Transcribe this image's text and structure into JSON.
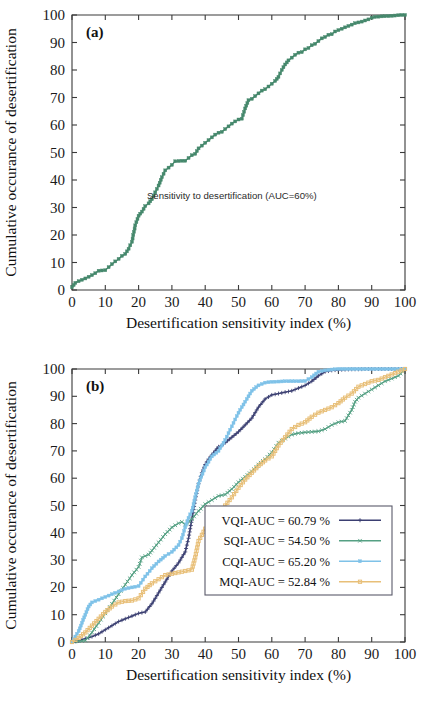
{
  "figure": {
    "background": "#ffffff"
  },
  "panel_a": {
    "tag": "(a)",
    "annotation": "Sensitivity to desertification (AUC=60%)",
    "xlabel": "Desertification sensitivity index (%)",
    "ylabel": "Cumulative occurance of desertification",
    "series_color": "#45886c"
  },
  "panel_b": {
    "tag": "(b)",
    "xlabel": "Desertification sensitivity index (%)",
    "ylabel": "Cumulative occurance of desertification",
    "legend": [
      {
        "label": "VQI-AUC = 60.79 %",
        "color": "#3b3f72",
        "marker": "plus"
      },
      {
        "label": "SQI-AUC = 54.50 %",
        "color": "#55a083",
        "marker": "cross"
      },
      {
        "label": "CQI-AUC = 65.20 %",
        "color": "#7fc2e8",
        "marker": "square"
      },
      {
        "label": "MQI-AUC = 52.84 %",
        "color": "#e8bf78",
        "marker": "square-open"
      }
    ]
  },
  "chart_data": [
    {
      "type": "line",
      "id": "panel-a",
      "title": "(a)",
      "xlabel": "Desertification sensitivity index (%)",
      "ylabel": "Cumulative occurance of desertification",
      "xlim": [
        0,
        100
      ],
      "ylim": [
        0,
        100
      ],
      "xticks": [
        0,
        10,
        20,
        30,
        40,
        50,
        60,
        70,
        80,
        90,
        100
      ],
      "yticks": [
        0,
        10,
        20,
        30,
        40,
        50,
        60,
        70,
        80,
        90,
        100
      ],
      "grid": false,
      "legend_position": "none",
      "annotations": [
        {
          "text": "Sensitivity to desertification (AUC=60%)",
          "x": 48,
          "y": 33
        }
      ],
      "series": [
        {
          "name": "Sensitivity to desertification (AUC=60%)",
          "color": "#45886c",
          "marker": "square",
          "x": [
            0,
            1,
            2,
            3,
            4,
            5,
            6,
            7,
            8,
            9,
            10,
            11,
            12,
            13,
            14,
            15,
            16,
            17,
            18,
            19,
            20,
            21,
            22,
            23,
            24,
            25,
            26,
            27,
            28,
            29,
            30,
            31,
            32,
            33,
            34,
            35,
            36,
            37,
            38,
            39,
            40,
            41,
            42,
            43,
            44,
            45,
            46,
            47,
            48,
            49,
            50,
            51,
            52,
            53,
            54,
            55,
            56,
            57,
            58,
            59,
            60,
            61,
            62,
            63,
            64,
            65,
            66,
            67,
            68,
            69,
            70,
            71,
            72,
            73,
            74,
            75,
            76,
            77,
            78,
            79,
            80,
            81,
            82,
            83,
            84,
            85,
            86,
            87,
            88,
            89,
            90,
            91,
            92,
            93,
            94,
            95,
            96,
            97,
            98,
            99,
            100
          ],
          "y": [
            1.0,
            2.6,
            3.2,
            3.7,
            4.2,
            4.8,
            5.4,
            6.1,
            7.0,
            7.1,
            7.2,
            8.3,
            9.4,
            10.4,
            11.3,
            12.4,
            13.1,
            15.0,
            17.5,
            23.5,
            27.0,
            28.5,
            30.5,
            31.5,
            33.0,
            35.5,
            38.0,
            41.0,
            43.5,
            44.5,
            45.5,
            46.8,
            46.9,
            47.0,
            47.0,
            48.0,
            49.0,
            49.5,
            51.5,
            52.5,
            53.5,
            54.5,
            55.5,
            56.5,
            57.2,
            57.5,
            58.5,
            59.5,
            60.5,
            61.3,
            62.0,
            62.3,
            66.0,
            69.0,
            69.5,
            70.5,
            71.5,
            72.5,
            73.0,
            74.0,
            75.0,
            76.0,
            77.5,
            80.0,
            82.0,
            83.5,
            84.5,
            85.5,
            86.3,
            86.5,
            87.5,
            88.0,
            89.0,
            89.5,
            90.5,
            91.5,
            92.0,
            92.8,
            93.0,
            94.0,
            94.5,
            95.0,
            95.5,
            96.0,
            96.5,
            97.0,
            97.3,
            97.6,
            98.0,
            98.4,
            99.0,
            99.3,
            99.4,
            99.5,
            99.55,
            99.6,
            99.7,
            99.8,
            99.9,
            100.0,
            100.0
          ]
        }
      ]
    },
    {
      "type": "line",
      "id": "panel-b",
      "title": "(b)",
      "xlabel": "Desertification sensitivity index (%)",
      "ylabel": "Cumulative occurance of desertification",
      "xlim": [
        0,
        100
      ],
      "ylim": [
        0,
        100
      ],
      "xticks": [
        0,
        10,
        20,
        30,
        40,
        50,
        60,
        70,
        80,
        90,
        100
      ],
      "yticks": [
        0,
        10,
        20,
        30,
        40,
        50,
        60,
        70,
        80,
        90,
        100
      ],
      "grid": false,
      "legend_position": "lower-right",
      "series": [
        {
          "name": "VQI-AUC = 60.79 %",
          "color": "#3b3f72",
          "marker": "plus",
          "x": [
            0,
            2,
            4,
            6,
            8,
            10,
            12,
            14,
            16,
            18,
            20,
            22,
            24,
            26,
            28,
            30,
            32,
            34,
            35,
            36,
            37,
            38,
            39,
            40,
            41,
            42,
            43,
            44,
            45,
            46,
            48,
            50,
            52,
            54,
            56,
            58,
            60,
            62,
            64,
            66,
            68,
            70,
            72,
            74,
            76,
            78,
            80,
            82,
            84,
            86,
            88,
            90,
            92,
            94,
            96,
            98,
            100
          ],
          "y": [
            0,
            0.5,
            1.2,
            2.0,
            3.0,
            4.5,
            6.0,
            7.5,
            8.5,
            9.5,
            10.5,
            11.0,
            14.0,
            18.0,
            22.0,
            26.0,
            29.0,
            33.0,
            38.0,
            45.0,
            52.0,
            58.0,
            62.0,
            65.0,
            67.0,
            68.5,
            70.0,
            71.5,
            72.0,
            73.0,
            75.0,
            77.0,
            79.5,
            82.0,
            86.0,
            89.0,
            90.5,
            91.0,
            91.5,
            92.0,
            93.0,
            94.0,
            95.5,
            97.5,
            99.0,
            99.5,
            99.7,
            99.8,
            99.9,
            99.9,
            100,
            100,
            100,
            100,
            100,
            100,
            100
          ]
        },
        {
          "name": "SQI-AUC = 54.50 %",
          "color": "#55a083",
          "marker": "cross",
          "x": [
            0,
            2,
            4,
            6,
            8,
            10,
            12,
            14,
            16,
            18,
            20,
            21,
            22,
            23,
            24,
            26,
            28,
            30,
            32,
            33,
            34,
            36,
            38,
            40,
            42,
            44,
            46,
            48,
            50,
            52,
            54,
            56,
            58,
            60,
            62,
            64,
            66,
            68,
            70,
            72,
            74,
            76,
            78,
            80,
            82,
            84,
            85,
            86,
            88,
            90,
            92,
            94,
            96,
            98,
            100
          ],
          "y": [
            0,
            0.3,
            0.5,
            3.5,
            7.0,
            10.5,
            14.0,
            17.5,
            21.0,
            24.5,
            27.5,
            31.0,
            31.5,
            32.0,
            33.5,
            36.5,
            39.5,
            42.0,
            43.5,
            44.0,
            43.0,
            45.0,
            48.0,
            50.5,
            52.0,
            53.5,
            54.0,
            56.0,
            58.5,
            60.5,
            62.5,
            65.0,
            67.0,
            69.5,
            73.0,
            74.5,
            76.0,
            76.5,
            76.8,
            77.0,
            77.2,
            78.0,
            79.5,
            80.5,
            81.0,
            85.0,
            88.0,
            89.5,
            91.0,
            92.5,
            94.0,
            95.5,
            96.5,
            97.5,
            100
          ]
        },
        {
          "name": "CQI-AUC = 65.20 %",
          "color": "#7fc2e8",
          "marker": "square",
          "x": [
            0,
            1,
            2,
            3,
            4,
            5,
            6,
            8,
            10,
            12,
            14,
            16,
            18,
            20,
            22,
            24,
            26,
            28,
            30,
            32,
            33,
            34,
            35,
            36,
            37,
            38,
            40,
            42,
            44,
            46,
            48,
            50,
            52,
            54,
            56,
            58,
            60,
            62,
            64,
            66,
            68,
            70,
            72,
            74,
            76,
            78,
            80,
            85,
            90,
            95,
            100
          ],
          "y": [
            0,
            2.0,
            4.0,
            7.0,
            10.0,
            13.0,
            14.5,
            15.5,
            16.5,
            17.5,
            18.5,
            19.5,
            20.0,
            20.5,
            24.0,
            27.0,
            29.5,
            31.5,
            33.0,
            35.5,
            38.0,
            42.0,
            45.5,
            48.0,
            53.0,
            58.0,
            64.0,
            68.0,
            70.0,
            74.0,
            79.0,
            84.0,
            88.0,
            92.0,
            94.0,
            95.0,
            95.3,
            95.4,
            95.5,
            95.5,
            95.5,
            95.6,
            97.0,
            99.0,
            99.5,
            99.8,
            100,
            100,
            100,
            100,
            100
          ]
        },
        {
          "name": "MQI-AUC = 52.84 %",
          "color": "#e8bf78",
          "marker": "square-open",
          "x": [
            0,
            2,
            4,
            6,
            8,
            10,
            12,
            14,
            16,
            18,
            20,
            22,
            24,
            26,
            28,
            30,
            32,
            34,
            36,
            37,
            38,
            40,
            42,
            44,
            46,
            48,
            50,
            52,
            54,
            56,
            58,
            60,
            62,
            64,
            66,
            68,
            70,
            72,
            74,
            76,
            78,
            80,
            82,
            84,
            86,
            88,
            90,
            92,
            94,
            96,
            98,
            100
          ],
          "y": [
            0,
            1.5,
            3.5,
            6.0,
            8.5,
            11.0,
            13.0,
            14.5,
            15.0,
            15.2,
            16.0,
            19.5,
            21.5,
            23.0,
            24.5,
            25.0,
            25.5,
            26.0,
            26.5,
            31.0,
            37.0,
            41.5,
            44.0,
            47.0,
            50.0,
            53.0,
            56.5,
            59.5,
            62.0,
            64.5,
            66.5,
            68.0,
            72.0,
            75.0,
            78.0,
            79.5,
            80.5,
            82.5,
            84.0,
            85.0,
            86.0,
            87.5,
            89.5,
            91.0,
            93.5,
            94.5,
            95.5,
            96.0,
            97.0,
            98.0,
            99.0,
            100
          ]
        }
      ]
    }
  ]
}
